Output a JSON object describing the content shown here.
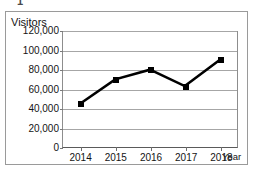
{
  "figure": {
    "number_label": "1"
  },
  "chart_data": {
    "type": "line",
    "title": "",
    "subtitle": "",
    "xlabel": "Year",
    "ylabel": "Visitors",
    "categories": [
      "2014",
      "2015",
      "2016",
      "2017",
      "2018"
    ],
    "values": [
      45000,
      70000,
      80000,
      63000,
      90000
    ],
    "series": [
      {
        "name": "Visitors",
        "values": [
          45000,
          70000,
          80000,
          63000,
          90000
        ]
      }
    ],
    "ylim": [
      0,
      120000
    ],
    "ytick_values": [
      0,
      20000,
      40000,
      60000,
      80000,
      100000,
      120000
    ],
    "ytick_labels": [
      "0",
      "20,000",
      "40,000",
      "60,000",
      "80,000",
      "100,000",
      "120,000"
    ],
    "xtick_labels": [
      "2014",
      "2015",
      "2016",
      "2017",
      "2018"
    ],
    "grid": "horizontal",
    "legend": "none",
    "line_color": "#000000",
    "marker_shape": "square",
    "marker_color": "#000000",
    "annotations": []
  }
}
